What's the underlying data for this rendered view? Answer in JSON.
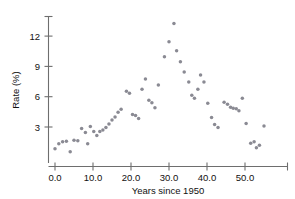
{
  "chart_data": {
    "type": "scatter",
    "title": "",
    "xlabel": "Years since 1950",
    "ylabel": "Rate (%)",
    "xlim": [
      -1.5,
      60.0
    ],
    "ylim": [
      0.0,
      13.6
    ],
    "xticks": [
      0.0,
      10.0,
      20.0,
      30.0,
      40.0,
      50.0
    ],
    "xticklabels": [
      "0.0",
      "10.0",
      "20.0",
      "30.0",
      "40.0",
      "50.0"
    ],
    "yticks": [
      3,
      6,
      9,
      12
    ],
    "yticklabels": [
      "3",
      "6",
      "9",
      "12"
    ],
    "grid": false,
    "legend": null,
    "marker_color": "#8a8a93",
    "axis_color": "#6e6e6e",
    "background_color": "#ffffff",
    "points": [
      {
        "x": 0.0,
        "y": 0.85
      },
      {
        "x": 1.0,
        "y": 1.35
      },
      {
        "x": 2.0,
        "y": 1.55
      },
      {
        "x": 3.0,
        "y": 1.6
      },
      {
        "x": 4.0,
        "y": 0.55
      },
      {
        "x": 5.0,
        "y": 1.7
      },
      {
        "x": 6.0,
        "y": 1.65
      },
      {
        "x": 7.0,
        "y": 2.85
      },
      {
        "x": 8.0,
        "y": 2.45
      },
      {
        "x": 8.6,
        "y": 1.35
      },
      {
        "x": 9.3,
        "y": 3.05
      },
      {
        "x": 10.2,
        "y": 2.55
      },
      {
        "x": 11.0,
        "y": 2.15
      },
      {
        "x": 11.8,
        "y": 2.55
      },
      {
        "x": 12.6,
        "y": 2.7
      },
      {
        "x": 13.4,
        "y": 2.95
      },
      {
        "x": 14.2,
        "y": 3.3
      },
      {
        "x": 15.0,
        "y": 3.7
      },
      {
        "x": 15.8,
        "y": 4.0
      },
      {
        "x": 16.6,
        "y": 4.45
      },
      {
        "x": 17.4,
        "y": 4.75
      },
      {
        "x": 18.8,
        "y": 6.55
      },
      {
        "x": 19.6,
        "y": 6.35
      },
      {
        "x": 20.4,
        "y": 4.25
      },
      {
        "x": 21.2,
        "y": 4.15
      },
      {
        "x": 22.0,
        "y": 3.85
      },
      {
        "x": 22.9,
        "y": 6.75
      },
      {
        "x": 23.8,
        "y": 7.75
      },
      {
        "x": 24.7,
        "y": 5.65
      },
      {
        "x": 25.5,
        "y": 5.4
      },
      {
        "x": 26.3,
        "y": 4.9
      },
      {
        "x": 27.2,
        "y": 7.15
      },
      {
        "x": 28.8,
        "y": 9.95
      },
      {
        "x": 30.0,
        "y": 11.45
      },
      {
        "x": 31.3,
        "y": 13.25
      },
      {
        "x": 32.0,
        "y": 10.55
      },
      {
        "x": 33.0,
        "y": 9.45
      },
      {
        "x": 34.0,
        "y": 8.45
      },
      {
        "x": 35.2,
        "y": 7.45
      },
      {
        "x": 36.0,
        "y": 6.15
      },
      {
        "x": 36.7,
        "y": 5.85
      },
      {
        "x": 37.6,
        "y": 6.75
      },
      {
        "x": 38.3,
        "y": 8.15
      },
      {
        "x": 39.2,
        "y": 7.45
      },
      {
        "x": 40.2,
        "y": 5.35
      },
      {
        "x": 41.2,
        "y": 3.95
      },
      {
        "x": 42.0,
        "y": 3.25
      },
      {
        "x": 42.9,
        "y": 2.95
      },
      {
        "x": 44.5,
        "y": 5.45
      },
      {
        "x": 45.4,
        "y": 5.25
      },
      {
        "x": 46.2,
        "y": 4.95
      },
      {
        "x": 46.9,
        "y": 4.85
      },
      {
        "x": 47.7,
        "y": 4.8
      },
      {
        "x": 48.4,
        "y": 4.6
      },
      {
        "x": 49.3,
        "y": 5.85
      },
      {
        "x": 50.3,
        "y": 3.35
      },
      {
        "x": 51.5,
        "y": 1.4
      },
      {
        "x": 52.4,
        "y": 1.55
      },
      {
        "x": 53.0,
        "y": 0.95
      },
      {
        "x": 53.8,
        "y": 1.2
      },
      {
        "x": 55.0,
        "y": 3.1
      }
    ]
  }
}
